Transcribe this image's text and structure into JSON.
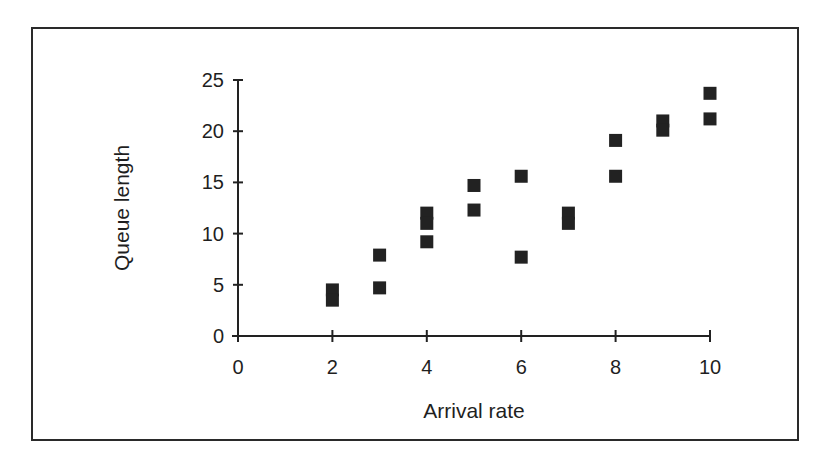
{
  "chart_data": {
    "type": "scatter",
    "title": "",
    "xlabel": "Arrival rate",
    "ylabel": "Queue length",
    "xlim": [
      0,
      10
    ],
    "ylim": [
      0,
      25
    ],
    "x_ticks": [
      0,
      2,
      4,
      6,
      8,
      10
    ],
    "y_ticks": [
      0,
      5,
      10,
      15,
      20,
      25
    ],
    "grid": false,
    "legend": null,
    "marker": "square",
    "marker_color": "#222222",
    "series": [
      {
        "name": "Queue length vs Arrival rate",
        "points": [
          {
            "x": 2,
            "y": 4.5
          },
          {
            "x": 2,
            "y": 3.5
          },
          {
            "x": 3,
            "y": 7.9
          },
          {
            "x": 3,
            "y": 4.7
          },
          {
            "x": 4,
            "y": 12.0
          },
          {
            "x": 4,
            "y": 11.0
          },
          {
            "x": 4,
            "y": 9.2
          },
          {
            "x": 5,
            "y": 14.7
          },
          {
            "x": 5,
            "y": 12.3
          },
          {
            "x": 6,
            "y": 15.6
          },
          {
            "x": 6,
            "y": 7.7
          },
          {
            "x": 7,
            "y": 12.0
          },
          {
            "x": 7,
            "y": 11.0
          },
          {
            "x": 8,
            "y": 19.1
          },
          {
            "x": 8,
            "y": 15.6
          },
          {
            "x": 9,
            "y": 21.0
          },
          {
            "x": 9,
            "y": 20.1
          },
          {
            "x": 10,
            "y": 23.7
          },
          {
            "x": 10,
            "y": 21.2
          }
        ]
      }
    ]
  }
}
